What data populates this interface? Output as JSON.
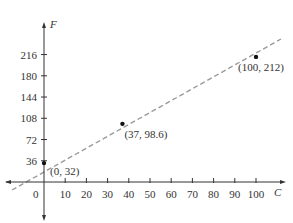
{
  "chart_data": {
    "type": "line",
    "title": "",
    "xlabel": "C",
    "ylabel": "F",
    "xlim": [
      -15,
      112
    ],
    "ylim": [
      -20,
      245
    ],
    "grid": false,
    "legend": null,
    "x_ticks": [
      10,
      20,
      30,
      40,
      50,
      60,
      70,
      80,
      90,
      100
    ],
    "y_ticks": [
      36,
      72,
      108,
      144,
      180,
      216
    ],
    "origin_label": "0",
    "series": [
      {
        "name": "F = 1.8C + 32",
        "style": "dashed",
        "color": "#9a9a9a",
        "x": [
          -15,
          110
        ],
        "y": [
          5,
          230
        ]
      }
    ],
    "points": [
      {
        "x": 0,
        "y": 32,
        "label": "(0, 32)"
      },
      {
        "x": 37,
        "y": 98.6,
        "label": "(37, 98.6)"
      },
      {
        "x": 100,
        "y": 212,
        "label": "(100, 212)"
      }
    ]
  }
}
